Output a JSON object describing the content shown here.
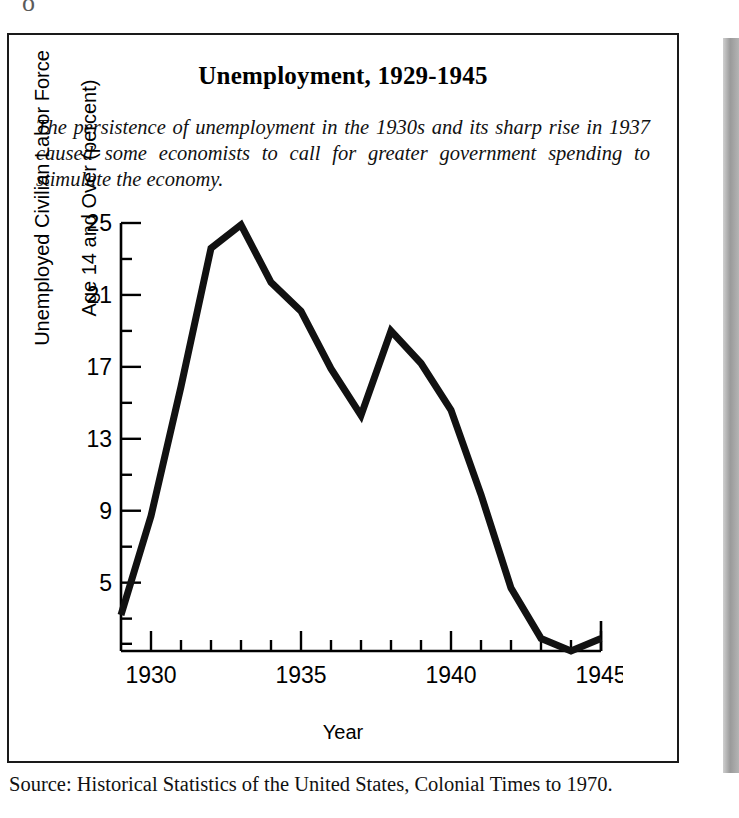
{
  "scan": {
    "top_glyph": "o"
  },
  "figure": {
    "title": "Unemployment, 1929-1945",
    "caption": "The persistence of unemployment in the 1930s and its sharp rise in 1937 caused some economists to call for greater government spending to stimulate the economy.",
    "source": "Source: Historical Statistics of the United States, Colonial Times to 1970."
  },
  "axis": {
    "ylabel_line1": "Unemployed Civilian Labor Force",
    "ylabel_line2": "Age 14 and Over (percent)",
    "xlabel": "Year",
    "y_major_labels": [
      "25",
      "21",
      "17",
      "13",
      "9",
      "5"
    ],
    "x_major_labels": [
      "1930",
      "1935",
      "1940",
      "1945"
    ]
  },
  "colors": {
    "line": "#111111",
    "axis": "#000000",
    "frame": "#1a1a1a",
    "background": "#ffffff",
    "gutter": "#9a9a9a"
  },
  "chart_data": {
    "type": "line",
    "title": "Unemployment, 1929-1945",
    "xlabel": "Year",
    "ylabel": "Unemployed Civilian Labor Force Age 14 and Over (percent)",
    "x": [
      1929,
      1930,
      1931,
      1932,
      1933,
      1934,
      1935,
      1936,
      1937,
      1938,
      1939,
      1940,
      1941,
      1942,
      1943,
      1944,
      1945
    ],
    "values": [
      3.2,
      8.7,
      15.9,
      23.6,
      24.9,
      21.7,
      20.1,
      16.9,
      14.3,
      19.0,
      17.2,
      14.6,
      9.9,
      4.7,
      1.9,
      1.2,
      1.9
    ],
    "xlim": [
      1929,
      1945
    ],
    "ylim": [
      1.2,
      25
    ],
    "y_major_ticks": [
      25,
      21,
      17,
      13,
      9,
      5
    ],
    "y_minor_tick_step": 2,
    "x_major_ticks": [
      1930,
      1935,
      1940,
      1945
    ],
    "x_minor_tick_step": 1,
    "grid": false,
    "legend": false,
    "series": [
      {
        "name": "Unemployment rate (percent)",
        "values": [
          3.2,
          8.7,
          15.9,
          23.6,
          24.9,
          21.7,
          20.1,
          16.9,
          14.3,
          19.0,
          17.2,
          14.6,
          9.9,
          4.7,
          1.9,
          1.2,
          1.9
        ]
      }
    ]
  }
}
